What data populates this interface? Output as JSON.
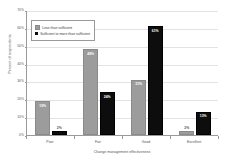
{
  "chart_data": {
    "type": "bar",
    "title": "",
    "xlabel": "Change management effectiveness",
    "ylabel": "Percent of respondents",
    "categories": [
      "Poor",
      "Fair",
      "Good",
      "Excellent"
    ],
    "series": [
      {
        "name": "Less than sufficient",
        "color": "#9c9c9c",
        "values": [
          19,
          48,
          31,
          2
        ],
        "labels": [
          "19%",
          "48%",
          "31%",
          "2%"
        ]
      },
      {
        "name": "Sufficient to more than sufficient",
        "color": "#0d0d0d",
        "values": [
          2,
          24,
          61,
          13
        ],
        "labels": [
          "2%",
          "24%",
          "61%",
          "13%"
        ]
      }
    ],
    "ylim": [
      0,
      70
    ],
    "yticks": [
      0,
      10,
      20,
      30,
      40,
      50,
      60,
      70
    ],
    "ytick_labels": [
      "0%",
      "10%",
      "20%",
      "30%",
      "40%",
      "50%",
      "60%",
      "70%"
    ],
    "grid": true,
    "legend_position": "top-left"
  },
  "legend": {
    "items": [
      {
        "label": "Less than sufficient"
      },
      {
        "label": "Sufficient to more than sufficient"
      }
    ]
  }
}
